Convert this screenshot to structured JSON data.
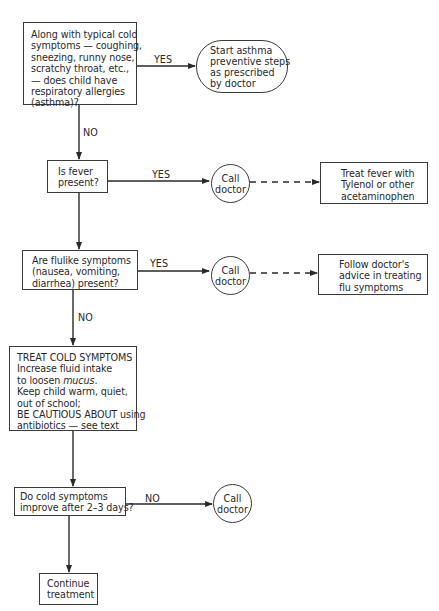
{
  "nodes": {
    "asthma_question": {
      "lines": [
        "Along with typical cold",
        "symptoms — coughing,",
        "sneezing, runny nose,",
        "scratchy throat, etc.,",
        "— does child have",
        "respiratory allergies",
        "(asthma)?"
      ]
    },
    "asthma_action": {
      "lines": [
        "Start asthma",
        "preventive steps",
        "as prescribed",
        "by doctor"
      ]
    },
    "fever_question": {
      "lines": [
        "Is fever",
        "present?"
      ]
    },
    "fever_call": {
      "lines": [
        "Call",
        "doctor"
      ]
    },
    "fever_treatment": {
      "lines": [
        "Treat fever with",
        "Tylenol or other",
        "acetaminophen"
      ]
    },
    "flu_question": {
      "lines": [
        "Are flulike symptoms",
        "(nausea, vomiting,",
        "diarrhea) present?"
      ]
    },
    "flu_call": {
      "lines": [
        "Call",
        "doctor"
      ]
    },
    "flu_treatment": {
      "lines": [
        "Follow doctor's",
        "advice in treating",
        "flu symptoms"
      ]
    },
    "treat_cold": {
      "heading": "TREAT COLD SYMPTOMS",
      "line1": "Increase fluid intake",
      "line2_prefix": "to loosen ",
      "line2_italic": "mucus",
      "line2_suffix": ".",
      "line3": "Keep child warm, quiet,",
      "line4": "out of school;",
      "line5": "BE CAUTIOUS ABOUT using",
      "line6": "antibiotics — see text"
    },
    "improve_question": {
      "lines": [
        "Do cold symptoms",
        "improve after 2–3 days?"
      ]
    },
    "improve_call": {
      "lines": [
        "Call",
        "doctor"
      ]
    },
    "continue": {
      "lines": [
        "Continue",
        "treatment"
      ]
    }
  },
  "edge_labels": {
    "asthma_yes": "YES",
    "asthma_no": "NO",
    "fever_yes": "YES",
    "flu_yes": "YES",
    "flu_no": "NO",
    "improve_no": "NO"
  },
  "colors": {
    "stroke": "#3a3a3a",
    "text": "#2a2a2a",
    "background": "#ffffff"
  }
}
